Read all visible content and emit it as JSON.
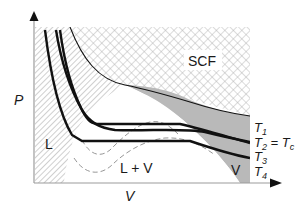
{
  "figure": {
    "type": "phase-diagram",
    "axes": {
      "x_label": "V",
      "y_label": "P"
    },
    "regions": {
      "supercritical": "SCF",
      "liquid": "L",
      "two_phase": "L + V",
      "vapor": "V"
    },
    "isotherms": [
      {
        "label": "T",
        "sub": "1",
        "suffix": ""
      },
      {
        "label": "T",
        "sub": "2",
        "suffix": " = T",
        "suffix_sub": "c"
      },
      {
        "label": "T",
        "sub": "3",
        "suffix": ""
      },
      {
        "label": "T",
        "sub": "4",
        "suffix": ""
      }
    ],
    "colors": {
      "curve": "#111111",
      "vapor_region": "#b4b4b4",
      "hatch": "#9a9a9a",
      "crosshatch": "#a8a8a8",
      "axis": "#9c9c9c",
      "dashed": "#8a8a8a"
    }
  }
}
